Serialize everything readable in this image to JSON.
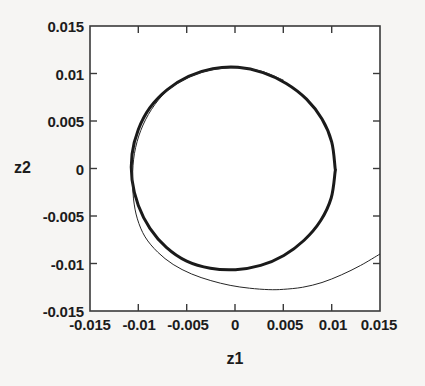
{
  "chart_data": {
    "type": "line",
    "title": "",
    "xlabel": "z1",
    "ylabel": "z2",
    "xlim": [
      -0.015,
      0.015
    ],
    "ylim": [
      -0.015,
      0.015
    ],
    "grid": false,
    "legend": "none",
    "xticks": [
      "-0.015",
      "-0.01",
      "-0.005",
      "0",
      "0.005",
      "0.01",
      "0.015"
    ],
    "yticks": [
      "0.015",
      "0.01",
      "0.005",
      "0",
      "-0.005",
      "-0.01",
      "-0.015"
    ],
    "xtick_values": [
      -0.015,
      -0.01,
      -0.005,
      0,
      0.005,
      0.01,
      0.015
    ],
    "ytick_values": [
      0.015,
      0.01,
      0.005,
      0,
      -0.005,
      -0.01,
      -0.015
    ],
    "series": [
      {
        "name": "limit-cycle",
        "style": "thick-solid",
        "color": "#1a1a1a",
        "linewidth": 3.0,
        "closed": true,
        "description": "Closed thick near-circular limit cycle centered near (-0.0003, 0.0001) with radius about 0.0104",
        "points": [
          [
            0.01035,
            0.0001
          ],
          [
            0.01,
            0.0028
          ],
          [
            0.009,
            0.0052
          ],
          [
            0.0074,
            0.0073
          ],
          [
            0.0053,
            0.00895
          ],
          [
            0.0029,
            0.0101
          ],
          [
            0.0003,
            0.01065
          ],
          [
            -0.0023,
            0.0105
          ],
          [
            -0.0048,
            0.0097
          ],
          [
            -0.007,
            0.0083
          ],
          [
            -0.0088,
            0.0064
          ],
          [
            -0.01,
            0.0041
          ],
          [
            -0.01065,
            0.0015
          ],
          [
            -0.01065,
            -0.0012
          ],
          [
            -0.01,
            -0.0039
          ],
          [
            -0.0088,
            -0.0063
          ],
          [
            -0.0071,
            -0.0083
          ],
          [
            -0.005,
            -0.00975
          ],
          [
            -0.00255,
            -0.0105
          ],
          [
            5e-05,
            -0.01065
          ],
          [
            0.00265,
            -0.0102
          ],
          [
            0.00505,
            -0.00915
          ],
          [
            0.00715,
            -0.00755
          ],
          [
            0.00885,
            -0.0055
          ],
          [
            0.00995,
            -0.0031
          ],
          [
            0.01035,
            -0.0004
          ],
          [
            0.01035,
            0.0001
          ]
        ]
      },
      {
        "name": "trajectory",
        "style": "thin-solid",
        "color": "#262626",
        "linewidth": 1.0,
        "closed": false,
        "description": "Thin trajectory entering from the right border near z2=-0.0090, dipping to a minimum near (0.0035, -0.0127), rising along the lower-left, then converging onto and tracking just inside the limit cycle around the left and top",
        "points": [
          [
            0.015,
            -0.009
          ],
          [
            0.013,
            -0.0102
          ],
          [
            0.011,
            -0.0112
          ],
          [
            0.009,
            -0.012
          ],
          [
            0.007,
            -0.0125
          ],
          [
            0.005,
            -0.01272
          ],
          [
            0.0035,
            -0.01275
          ],
          [
            0.0015,
            -0.0126
          ],
          [
            -0.0005,
            -0.0123
          ],
          [
            -0.0025,
            -0.0118
          ],
          [
            -0.0045,
            -0.0111
          ],
          [
            -0.0064,
            -0.0101
          ],
          [
            -0.008,
            -0.0088
          ],
          [
            -0.0093,
            -0.0072
          ],
          [
            -0.0101,
            -0.0053
          ],
          [
            -0.0105,
            -0.0032
          ],
          [
            -0.0106,
            -0.0009
          ],
          [
            -0.0104,
            0.0016
          ],
          [
            -0.00975,
            0.004
          ],
          [
            -0.00865,
            0.0062
          ],
          [
            -0.0071,
            0.0081
          ],
          [
            -0.005,
            0.0095
          ],
          [
            -0.0026,
            0.01035
          ],
          [
            0.0001,
            0.0106
          ],
          [
            0.0027,
            0.01025
          ],
          [
            0.005,
            0.0093
          ]
        ]
      }
    ]
  },
  "axes": {
    "box_color": "#3a3a3a",
    "background": "#ffffff"
  },
  "page": {
    "background": "#f6f5f3",
    "bleed_through": [
      "",
      ""
    ]
  }
}
